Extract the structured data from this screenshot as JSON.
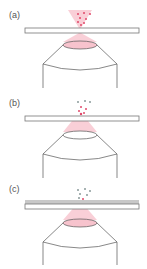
{
  "figure": {
    "panels": [
      {
        "label": "(a)",
        "top": 0,
        "cover_layer": false,
        "particles": "in_beam",
        "beam_above_slide": true
      },
      {
        "label": "(b)",
        "top": 88,
        "cover_layer": false,
        "particles": "near_surface",
        "beam_above_slide": false
      },
      {
        "label": "(c)",
        "top": 178,
        "cover_layer": true,
        "particles": "above_layer",
        "beam_above_slide": false
      }
    ],
    "colors": {
      "beam": "#f7b8c4",
      "particle_in_beam": "#e0486a",
      "particle_gray": "#8a9a9a",
      "outline": "#555555",
      "cover_layer": "#c8c8c8"
    }
  }
}
